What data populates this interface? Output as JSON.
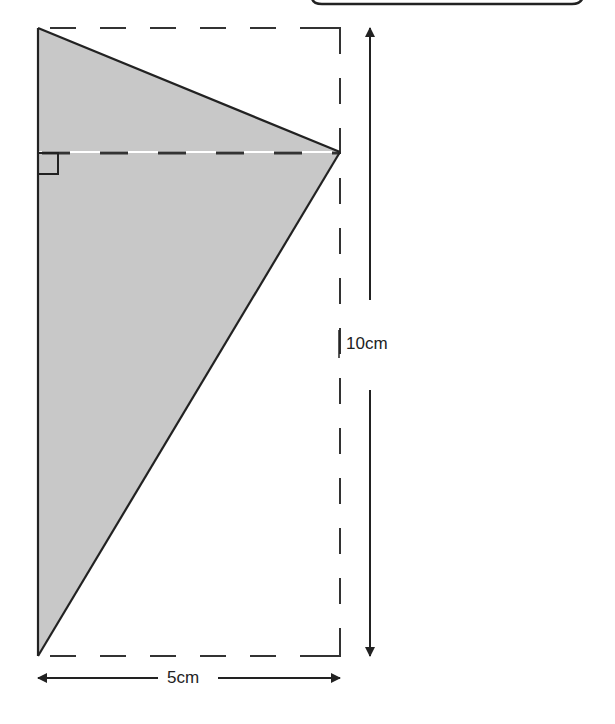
{
  "diagram": {
    "type": "geometry",
    "colors": {
      "shade": "#c8c8c8",
      "stroke": "#222222",
      "background": "#ffffff"
    },
    "dimensions": {
      "height_label": "10cm",
      "width_label": "5cm"
    },
    "right_angle_marker": true
  }
}
